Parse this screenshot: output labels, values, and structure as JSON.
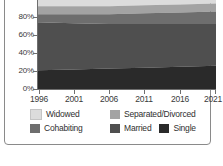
{
  "chart_data": {
    "type": "area",
    "title": "",
    "subtitle": "",
    "xlabel": "",
    "ylabel": "",
    "stacked": "100%",
    "grid": false,
    "legend_position": "bottom",
    "x": [
      1996,
      2001,
      2006,
      2011,
      2016,
      2021
    ],
    "xtick_labels": [
      "1996",
      "2001",
      "2006",
      "2011",
      "2016",
      "2021"
    ],
    "ytick_labels": [
      "0%",
      "20%",
      "40%",
      "60%",
      "80%"
    ],
    "ylim": [
      0,
      100
    ],
    "ytick_values": [
      0,
      20,
      40,
      60,
      80
    ],
    "categories": [
      "1996",
      "2001",
      "2006",
      "2011",
      "2016",
      "2021"
    ],
    "series": [
      {
        "name": "Single",
        "color": "#2a2a2a",
        "values": [
          21,
          22,
          23,
          24,
          25,
          26
        ]
      },
      {
        "name": "Married",
        "color": "#4f4f4f",
        "values": [
          54,
          52,
          50,
          49,
          48,
          47
        ]
      },
      {
        "name": "Cohabiting",
        "color": "#6e6e6e",
        "values": [
          9,
          10,
          11,
          12,
          13,
          14
        ]
      },
      {
        "name": "Separated/Divorced",
        "color": "#a3a3a3",
        "values": [
          9,
          9,
          9,
          9,
          9,
          9
        ]
      },
      {
        "name": "Widowed",
        "color": "#dcdcdc",
        "values": [
          7,
          7,
          7,
          6,
          5,
          4
        ]
      }
    ],
    "legend_entries": [
      {
        "label": "Widowed",
        "color": "#dcdcdc"
      },
      {
        "label": "Separated/Divorced",
        "color": "#a3a3a3"
      },
      {
        "label": "Cohabiting",
        "color": "#6e6e6e"
      },
      {
        "label": "Married",
        "color": "#4f4f4f"
      },
      {
        "label": "Single",
        "color": "#2a2a2a"
      }
    ]
  },
  "axis": {
    "y_ticks": [
      {
        "label": "80%",
        "top": 13
      },
      {
        "label": "60%",
        "top": 31
      },
      {
        "label": "40%",
        "top": 49
      },
      {
        "label": "20%",
        "top": 67
      },
      {
        "label": "0%",
        "top": 85
      }
    ],
    "x_ticks": [
      {
        "label": "1996",
        "left": 39
      },
      {
        "label": "2001",
        "left": 74
      },
      {
        "label": "2006",
        "left": 109
      },
      {
        "label": "2011",
        "left": 144
      },
      {
        "label": "2016",
        "left": 180
      },
      {
        "label": "2021",
        "left": 215
      }
    ]
  },
  "legend": {
    "row1": [
      {
        "label": "Widowed",
        "color": "#dcdcdc"
      },
      {
        "label": "Separated/Divorced",
        "color": "#a3a3a3"
      }
    ],
    "row2": [
      {
        "label": "Cohabiting",
        "color": "#6e6e6e"
      },
      {
        "label": "Married",
        "color": "#4f4f4f"
      },
      {
        "label": "Single",
        "color": "#2a2a2a"
      }
    ]
  }
}
